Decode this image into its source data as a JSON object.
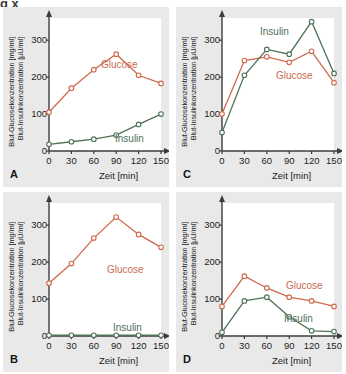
{
  "figure": {
    "cut_top_text": "g                                              x",
    "background": "#e9e9e9",
    "plot_background": "#ffffff"
  },
  "colors": {
    "glucose": "#cf6a4d",
    "insulin": "#4f7258",
    "axis": "#3c3c3c",
    "text": "#1c1c1c",
    "panel_bg": "#e9e9e9",
    "plot_bg": "#ffffff"
  },
  "axes": {
    "ylabel_line1": "Blut-Glucosekonzentration [mg/ml]",
    "ylabel_line2": "Blut-Insulinkonzentration [µU/ml]",
    "xlabel": "Zeit [min]",
    "yticks": [
      "0",
      "100",
      "200",
      "300"
    ],
    "ytick_values": [
      0,
      100,
      200,
      300
    ],
    "xticks": [
      "0",
      "30",
      "60",
      "90",
      "120",
      "150"
    ],
    "xtick_values": [
      0,
      30,
      60,
      90,
      120,
      150
    ],
    "xlim": [
      0,
      150
    ],
    "ylim": [
      0,
      360
    ],
    "grid": false
  },
  "legend": {
    "glucose": "Glucose",
    "insulin": "Insulin"
  },
  "panels": [
    {
      "letter": "A",
      "id": "panelA"
    },
    {
      "letter": "B",
      "id": "panelB"
    },
    {
      "letter": "C",
      "id": "panelC"
    },
    {
      "letter": "D",
      "id": "panelD"
    }
  ],
  "chart_data": [
    {
      "type": "line",
      "panel": "A",
      "title": "",
      "xlabel": "Zeit [min]",
      "ylabel": "Blut-Glucosekonzentration [mg/ml] / Blut-Insulinkonzentration [µU/ml]",
      "x": [
        0,
        30,
        60,
        90,
        120,
        150
      ],
      "xlim": [
        0,
        150
      ],
      "ylim": [
        0,
        360
      ],
      "grid": false,
      "legend_position": "inline-annotation",
      "series": [
        {
          "name": "Glucose",
          "color": "#cf6a4d",
          "values": [
            105,
            170,
            220,
            262,
            205,
            183
          ]
        },
        {
          "name": "Insulin",
          "color": "#4f7258",
          "values": [
            18,
            25,
            32,
            43,
            72,
            100
          ]
        }
      ]
    },
    {
      "type": "line",
      "panel": "B",
      "title": "",
      "xlabel": "Zeit [min]",
      "ylabel": "Blut-Glucosekonzentration [mg/ml] / Blut-Insulinkonzentration [µU/ml]",
      "x": [
        0,
        30,
        60,
        90,
        120,
        150
      ],
      "xlim": [
        0,
        150
      ],
      "ylim": [
        0,
        360
      ],
      "grid": false,
      "legend_position": "inline-annotation",
      "series": [
        {
          "name": "Glucose",
          "color": "#cf6a4d",
          "values": [
            143,
            196,
            265,
            322,
            275,
            240
          ]
        },
        {
          "name": "Insulin",
          "color": "#4f7258",
          "values": [
            2,
            2,
            2,
            2,
            2,
            2
          ]
        }
      ]
    },
    {
      "type": "line",
      "panel": "C",
      "title": "",
      "xlabel": "Zeit [min]",
      "ylabel": "Blut-Glucosekonzentration [mg/ml] / Blut-Insulinkonzentration [µU/ml]",
      "x": [
        0,
        30,
        60,
        90,
        120,
        150
      ],
      "xlim": [
        0,
        150
      ],
      "ylim": [
        0,
        360
      ],
      "grid": false,
      "legend_position": "inline-annotation",
      "series": [
        {
          "name": "Glucose",
          "color": "#cf6a4d",
          "values": [
            100,
            245,
            255,
            240,
            270,
            185
          ]
        },
        {
          "name": "Insulin",
          "color": "#4f7258",
          "values": [
            50,
            205,
            275,
            262,
            350,
            210
          ]
        }
      ]
    },
    {
      "type": "line",
      "panel": "D",
      "title": "",
      "xlabel": "Zeit [min]",
      "ylabel": "Blut-Glucosekonzentration [mg/ml] / Blut-Insulinkonzentration [µU/ml]",
      "x": [
        0,
        30,
        60,
        90,
        120,
        150
      ],
      "xlim": [
        0,
        150
      ],
      "ylim": [
        0,
        360
      ],
      "grid": false,
      "legend_position": "inline-annotation",
      "series": [
        {
          "name": "Glucose",
          "color": "#cf6a4d",
          "values": [
            80,
            162,
            130,
            105,
            95,
            80
          ]
        },
        {
          "name": "Insulin",
          "color": "#4f7258",
          "values": [
            10,
            95,
            105,
            52,
            14,
            12
          ]
        }
      ]
    }
  ],
  "annotations": {
    "A": {
      "glucose": {
        "x": 98,
        "y": 52
      },
      "insulin": {
        "x": 112,
        "y": 126
      }
    },
    "B": {
      "glucose": {
        "x": 104,
        "y": 72
      },
      "insulin": {
        "x": 110,
        "y": 130
      }
    },
    "C": {
      "glucose": {
        "x": 100,
        "y": 63
      },
      "insulin": {
        "x": 84,
        "y": 19
      }
    },
    "D": {
      "glucose": {
        "x": 110,
        "y": 88
      },
      "insulin": {
        "x": 108,
        "y": 121
      }
    }
  }
}
